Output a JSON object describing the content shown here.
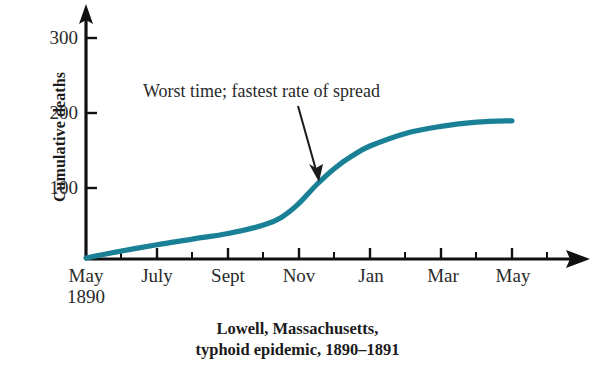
{
  "chart_data": {
    "type": "line",
    "title": "",
    "caption_line1": "Lowell, Massachusetts,",
    "caption_line2": "typhoid epidemic, 1890–1891",
    "ylabel": "Cumulative deaths",
    "xlabel": "",
    "accent_color": "#1a8096",
    "axis_color": "#111111",
    "grid": false,
    "legend": "none",
    "ylim": [
      0,
      330
    ],
    "yticks": [
      100,
      200,
      300
    ],
    "ytick_labels": [
      "100",
      "200",
      "300"
    ],
    "xlim": [
      0,
      13
    ],
    "xtick_labels": [
      "May",
      "July",
      "Sept",
      "Nov",
      "Jan",
      "Mar",
      "May"
    ],
    "xtick_sublabel": "1890",
    "xtick_months": [
      0,
      2,
      4,
      6,
      8,
      10,
      12
    ],
    "minor_ticks_per_major": 1,
    "annotation": {
      "text": "Worst time; fastest rate of spread",
      "points_to_month": 6.2,
      "points_to_value": 105
    },
    "x": [
      0,
      1,
      2,
      3,
      4,
      5,
      5.5,
      6,
      6.5,
      7,
      7.5,
      8,
      9,
      10,
      11,
      12
    ],
    "values": [
      0,
      10,
      19,
      27,
      35,
      47,
      58,
      78,
      105,
      128,
      146,
      160,
      178,
      188,
      194,
      196
    ],
    "series": [
      {
        "name": "Cumulative deaths",
        "values": [
          0,
          10,
          19,
          27,
          35,
          47,
          58,
          78,
          105,
          128,
          146,
          160,
          178,
          188,
          194,
          196
        ]
      }
    ]
  },
  "axis": {
    "y_arrow": "up-arrow-icon",
    "x_arrow": "right-arrow-icon"
  }
}
